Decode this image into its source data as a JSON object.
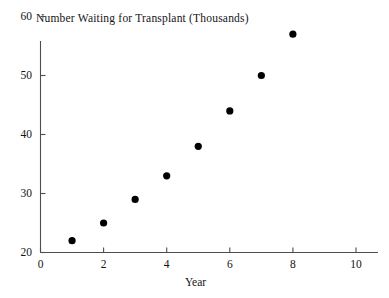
{
  "chart_data": {
    "type": "scatter",
    "title": "Number Waiting for Transplant (Thousands)",
    "xlabel": "Year",
    "ylabel": "",
    "x": [
      1,
      2,
      3,
      4,
      5,
      6,
      7,
      8,
      9,
      10
    ],
    "values": [
      22,
      25,
      29,
      33,
      38,
      44,
      50,
      57,
      64,
      72
    ],
    "series": [
      {
        "name": "Number Waiting for Transplant (Thousands)",
        "values": [
          22,
          25,
          29,
          33,
          38,
          44,
          50,
          57,
          64,
          72
        ]
      }
    ],
    "xlim": [
      0,
      10.9
    ],
    "ylim": [
      20,
      74
    ],
    "xticks": [
      0,
      2,
      4,
      6,
      8,
      10
    ],
    "yticks": [
      20,
      30,
      40,
      50,
      60,
      70
    ],
    "xtick_labels": [
      "0",
      "2",
      "4",
      "6",
      "8",
      "10"
    ],
    "ytick_labels": [
      "20",
      "30",
      "40",
      "50",
      "60",
      "70"
    ],
    "grid": false,
    "legend": null,
    "marker": "filled-circle",
    "marker_color": "#000000",
    "axis_color": "#4d4d52",
    "background": "#ffffff"
  }
}
